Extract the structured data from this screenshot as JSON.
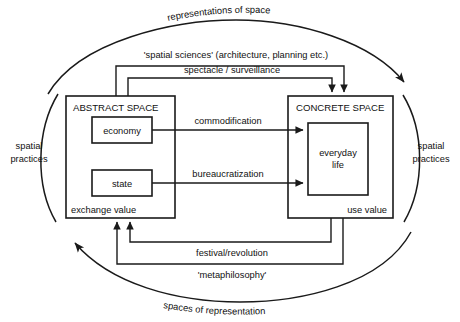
{
  "diagram": {
    "title_top_arc": "representations of space",
    "title_bottom_arc": "spaces of representation",
    "left_arc_label_line1": "spatial",
    "left_arc_label_line2": "practices",
    "right_arc_label_line1": "spatial",
    "right_arc_label_line2": "practices",
    "boxes": {
      "abstract_space": {
        "title": "ABSTRACT SPACE",
        "footer": "exchange value",
        "children": [
          {
            "label": "economy"
          },
          {
            "label": "state"
          }
        ]
      },
      "concrete_space": {
        "title": "CONCRETE SPACE",
        "footer": "use value",
        "children": [
          {
            "label_line1": "everyday",
            "label_line2": "life"
          }
        ]
      }
    },
    "connectors": [
      {
        "id": "spatial-sciences",
        "label": "'spatial sciences' (architecture, planning etc.)",
        "direction": "abstract-to-concrete"
      },
      {
        "id": "spectacle-surveillance",
        "label": "spectacle / surveillance",
        "direction": "abstract-to-concrete"
      },
      {
        "id": "commodification",
        "label": "commodification",
        "direction": "economy-to-everyday-life"
      },
      {
        "id": "bureaucratization",
        "label": "bureaucratization",
        "direction": "state-to-everyday-life"
      },
      {
        "id": "festival-revolution",
        "label": "festival/revolution",
        "direction": "concrete-to-abstract"
      },
      {
        "id": "metaphilosophy",
        "label": "'metaphilosophy'",
        "direction": "concrete-to-abstract"
      }
    ],
    "colors": {
      "stroke": "#1a1a1a",
      "background": "#ffffff",
      "text": "#111111"
    }
  }
}
